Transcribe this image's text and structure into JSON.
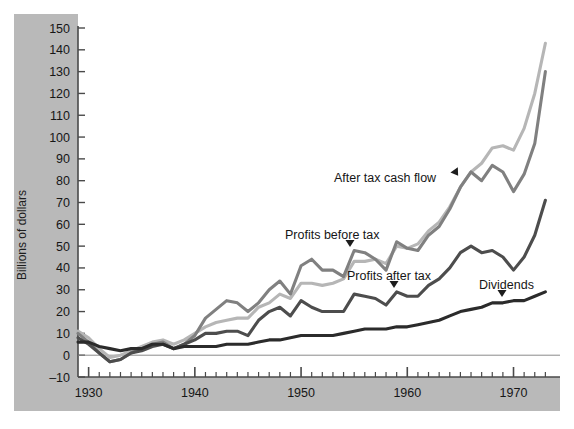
{
  "chart_data": {
    "type": "line",
    "title": "",
    "xlabel": "",
    "ylabel": "Billions of dollars",
    "xlim": [
      1929,
      1974
    ],
    "ylim": [
      -10,
      150
    ],
    "ytick_step": 10,
    "yticks": [
      -10,
      0,
      10,
      20,
      30,
      40,
      50,
      60,
      70,
      80,
      90,
      100,
      110,
      120,
      130,
      140,
      150
    ],
    "ytick_labels": [
      "–10",
      "0",
      "10",
      "20",
      "30",
      "40",
      "50",
      "60",
      "70",
      "80",
      "90",
      "100",
      "110",
      "120",
      "130",
      "140",
      "150"
    ],
    "xticks_major": [
      1930,
      1940,
      1950,
      1960,
      1970
    ],
    "xtick_labels": [
      "1930",
      "1940",
      "1950",
      "1960",
      "1970"
    ],
    "xticks_minor_step": 1,
    "grid": false,
    "zero_line": true,
    "legend": "inline-annotations",
    "x": [
      1929,
      1930,
      1931,
      1932,
      1933,
      1934,
      1935,
      1936,
      1937,
      1938,
      1939,
      1940,
      1941,
      1942,
      1943,
      1944,
      1945,
      1946,
      1947,
      1948,
      1949,
      1950,
      1951,
      1952,
      1953,
      1954,
      1955,
      1956,
      1957,
      1958,
      1959,
      1960,
      1961,
      1962,
      1963,
      1964,
      1965,
      1966,
      1967,
      1968,
      1969,
      1970,
      1971,
      1972,
      1973
    ],
    "series": [
      {
        "name": "After tax cash flow",
        "color": "#b6b6b6",
        "annotation": "After  tax cash  flow",
        "values": [
          11,
          8,
          3,
          -1,
          0,
          2,
          4,
          6,
          7,
          5,
          7,
          10,
          13,
          15,
          16,
          17,
          17,
          22,
          24,
          28,
          26,
          33,
          33,
          32,
          33,
          35,
          43,
          43,
          44,
          42,
          50,
          49,
          51,
          57,
          61,
          68,
          77,
          84,
          88,
          95,
          96,
          94,
          104,
          120,
          143
        ]
      },
      {
        "name": "Profits before tax",
        "color": "#808080",
        "annotation": "Profits before tax",
        "values": [
          10,
          6,
          1,
          -3,
          -2,
          1,
          3,
          5,
          6,
          3,
          5,
          9,
          17,
          21,
          25,
          24,
          20,
          24,
          30,
          34,
          28,
          41,
          44,
          39,
          39,
          36,
          48,
          47,
          44,
          39,
          52,
          49,
          48,
          55,
          59,
          67,
          77,
          84,
          80,
          87,
          84,
          75,
          83,
          97,
          130
        ]
      },
      {
        "name": "Profits after tax",
        "color": "#4d4d4d",
        "annotation": "Profits after tax",
        "values": [
          8,
          5,
          1,
          -3,
          -2,
          1,
          2,
          4,
          5,
          3,
          5,
          7,
          10,
          10,
          11,
          11,
          9,
          16,
          20,
          22,
          18,
          25,
          22,
          20,
          20,
          20,
          28,
          27,
          26,
          23,
          29,
          27,
          27,
          32,
          35,
          40,
          47,
          50,
          47,
          48,
          45,
          39,
          45,
          55,
          71
        ]
      },
      {
        "name": "Dividends",
        "color": "#2b2b2b",
        "annotation": "Dividends",
        "values": [
          6,
          6,
          4,
          3,
          2,
          3,
          3,
          5,
          5,
          3,
          4,
          4,
          4,
          4,
          5,
          5,
          5,
          6,
          7,
          7,
          8,
          9,
          9,
          9,
          9,
          10,
          11,
          12,
          12,
          12,
          13,
          13,
          14,
          15,
          16,
          18,
          20,
          21,
          22,
          24,
          24,
          25,
          25,
          27,
          29
        ]
      }
    ],
    "annotations": [
      {
        "id": "after-tax-cash-flow",
        "text": "After  tax cash  flow",
        "x": 334,
        "y": 182,
        "pointer": {
          "x": 457,
          "y": 174,
          "angle": -35
        }
      },
      {
        "id": "profits-before-tax",
        "text": "Profits before tax",
        "x": 285,
        "y": 239,
        "pointer": {
          "x": 350,
          "y": 245,
          "angle": 0
        }
      },
      {
        "id": "profits-after-tax",
        "text": "Profits after tax",
        "x": 347,
        "y": 280,
        "pointer": {
          "x": 394,
          "y": 286,
          "angle": 0
        }
      },
      {
        "id": "dividends",
        "text": "Dividends",
        "x": 479,
        "y": 289,
        "pointer": {
          "x": 502,
          "y": 295,
          "angle": 0
        }
      }
    ],
    "colors": {
      "panel_band": "#b9b9b9",
      "plot_background": "#ffffff",
      "axis": "#4a4a4a",
      "text": "#161616"
    }
  }
}
